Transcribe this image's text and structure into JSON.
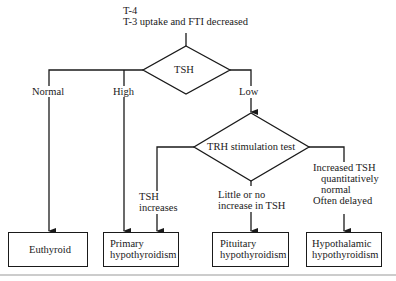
{
  "header": {
    "line1": "T-4",
    "line2": "T-3 uptake and FTI decreased"
  },
  "decisions": {
    "tsh": "TSH",
    "trh": "TRH stimulation test"
  },
  "branches": {
    "normal": "Normal",
    "high": "High",
    "low": "Low",
    "tsh_increases_1": "TSH",
    "tsh_increases_2": "increases",
    "little_1": "Little or no",
    "little_2": "increase in TSH",
    "increased_1": "Increased TSH",
    "increased_2": "quantitatively",
    "increased_3": "normal",
    "increased_4": "Often delayed"
  },
  "outcomes": {
    "euthyroid": "Euthyroid",
    "primary_1": "Primary",
    "primary_2": "hypothyroidism",
    "pituitary_1": "Pituitary",
    "pituitary_2": "hypothyroidism",
    "hypothalamic_1": "Hypothalamic",
    "hypothalamic_2": "hypothyroidism"
  }
}
